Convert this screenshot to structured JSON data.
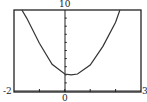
{
  "chart_data": {
    "type": "line",
    "title": "",
    "xlabel": "",
    "ylabel": "",
    "xlim": [
      -2,
      3
    ],
    "ylim": [
      0,
      10
    ],
    "tick_labels": {
      "x_min": "-2",
      "x_max": "3",
      "x_origin": "0",
      "y_max": "10"
    },
    "x_ticks": [
      -1,
      0,
      1,
      2
    ],
    "y_ticks": [
      1,
      2,
      3,
      4,
      5,
      6,
      7,
      8,
      9
    ],
    "grid": false,
    "series": [
      {
        "name": "f(x)",
        "x": [
          -1.69,
          -1.5,
          -1.0,
          -0.5,
          0.0,
          0.25,
          0.5,
          1.0,
          1.5,
          2.0,
          2.17
        ],
        "y": [
          10.0,
          9.0,
          5.9,
          3.3,
          2.1,
          2.0,
          2.1,
          3.2,
          5.5,
          8.5,
          10.0
        ]
      }
    ],
    "colors": {
      "curve": "#333333",
      "axis": "#222222",
      "frame": "#222222"
    }
  }
}
